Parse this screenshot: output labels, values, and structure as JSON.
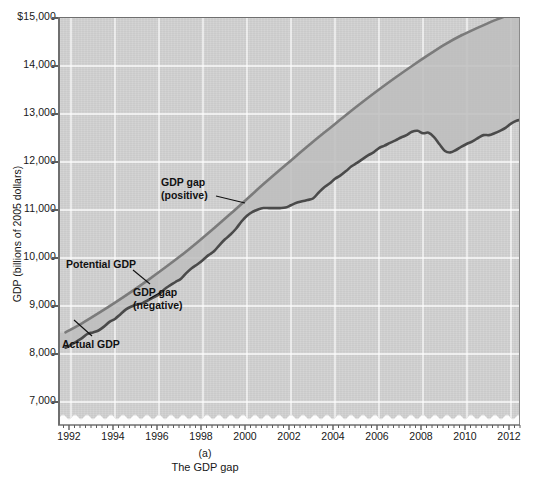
{
  "figure": {
    "panel_label": "(a)",
    "caption": "The GDP gap",
    "y_axis_title": "GDP (billions of 2005 dollars)",
    "background_color": "#d2d2d2",
    "gridline_color": "#ffffff",
    "axis_color": "#6f6f6f"
  },
  "annotations": {
    "gap_positive_line1": "GDP gap",
    "gap_positive_line2": "(positive)",
    "potential": "Potential GDP",
    "gap_negative_line1": "GDP gap",
    "gap_negative_line2": "(negative)",
    "actual": "Actual GDP"
  },
  "chart_data": {
    "type": "line",
    "title": "The GDP gap",
    "subtitle": "(a)",
    "xlabel": "",
    "ylabel": "GDP (billions of 2005 dollars)",
    "xlim": [
      1991.5,
      2012.5
    ],
    "ylim": [
      6500,
      15000
    ],
    "y_axis_break": true,
    "grid": true,
    "legend_position": "inline-annotations",
    "x_tick_labels": [
      "1992",
      "1994",
      "1996",
      "1998",
      "2000",
      "2002",
      "2004",
      "2006",
      "2008",
      "2010",
      "2012"
    ],
    "x_tick_values": [
      1992,
      1994,
      1996,
      1998,
      2000,
      2002,
      2004,
      2006,
      2008,
      2010,
      2012
    ],
    "x_minor_tick_interval": 0.25,
    "y_tick_labels": [
      "$15,000",
      "14,000",
      "13,000",
      "12,000",
      "11,000",
      "10,000",
      "9,000",
      "8,000",
      "7,000"
    ],
    "y_tick_values": [
      15000,
      14000,
      13000,
      12000,
      11000,
      10000,
      9000,
      8000,
      7000
    ],
    "series": [
      {
        "name": "Potential GDP",
        "color": "#7b7b7b",
        "line_width": 2.6,
        "x": [
          1991.75,
          1992.5,
          1993.25,
          1994.0,
          1994.75,
          1995.5,
          1996.25,
          1997.0,
          1997.75,
          1998.5,
          1999.25,
          2000.0,
          2000.75,
          2001.5,
          2002.25,
          2003.0,
          2003.75,
          2004.5,
          2005.25,
          2006.0,
          2006.75,
          2007.5,
          2008.25,
          2009.0,
          2009.75,
          2010.5,
          2011.25,
          2012.0,
          2012.5
        ],
        "values": [
          8450,
          8640,
          8850,
          9070,
          9300,
          9540,
          9790,
          10050,
          10330,
          10620,
          10920,
          11230,
          11540,
          11840,
          12130,
          12420,
          12700,
          12980,
          13250,
          13510,
          13760,
          14000,
          14230,
          14450,
          14640,
          14800,
          14950,
          15080,
          15160
        ]
      },
      {
        "name": "Actual GDP",
        "color": "#4a4a4a",
        "line_width": 2.6,
        "x": [
          1991.75,
          1992.0,
          1992.25,
          1992.5,
          1992.75,
          1993.0,
          1993.25,
          1993.5,
          1993.75,
          1994.0,
          1994.25,
          1994.5,
          1994.75,
          1995.0,
          1995.25,
          1995.5,
          1995.75,
          1996.0,
          1996.25,
          1996.5,
          1996.75,
          1997.0,
          1997.25,
          1997.5,
          1997.75,
          1998.0,
          1998.25,
          1998.5,
          1998.75,
          1999.0,
          1999.25,
          1999.5,
          1999.75,
          2000.0,
          2000.25,
          2000.5,
          2000.75,
          2001.0,
          2001.25,
          2001.5,
          2001.75,
          2002.0,
          2002.25,
          2002.5,
          2002.75,
          2003.0,
          2003.25,
          2003.5,
          2003.75,
          2004.0,
          2004.25,
          2004.5,
          2004.75,
          2005.0,
          2005.25,
          2005.5,
          2005.75,
          2006.0,
          2006.25,
          2006.5,
          2006.75,
          2007.0,
          2007.25,
          2007.5,
          2007.75,
          2008.0,
          2008.25,
          2008.5,
          2008.75,
          2009.0,
          2009.25,
          2009.5,
          2009.75,
          2010.0,
          2010.25,
          2010.5,
          2010.75,
          2011.0,
          2011.25,
          2011.5,
          2011.75,
          2012.0,
          2012.25,
          2012.5
        ],
        "values": [
          8130,
          8190,
          8260,
          8330,
          8420,
          8450,
          8490,
          8570,
          8670,
          8730,
          8830,
          8930,
          8990,
          9030,
          9060,
          9120,
          9180,
          9240,
          9350,
          9430,
          9500,
          9570,
          9690,
          9790,
          9870,
          9960,
          10060,
          10140,
          10270,
          10390,
          10490,
          10610,
          10760,
          10880,
          10960,
          11010,
          11040,
          11040,
          11040,
          11040,
          11050,
          11100,
          11150,
          11180,
          11210,
          11240,
          11360,
          11470,
          11550,
          11650,
          11720,
          11810,
          11910,
          11980,
          12060,
          12140,
          12200,
          12290,
          12340,
          12400,
          12450,
          12510,
          12560,
          12630,
          12650,
          12600,
          12610,
          12520,
          12370,
          12230,
          12200,
          12250,
          12320,
          12380,
          12430,
          12500,
          12560,
          12560,
          12600,
          12650,
          12710,
          12800,
          12860,
          12880
        ]
      }
    ],
    "gap_regions": [
      {
        "label": "GDP gap (positive)",
        "start": 1998.6,
        "end": 2001.2,
        "sign": "positive"
      },
      {
        "label": "GDP gap (negative)",
        "start": 1991.75,
        "end": 1998.6,
        "sign": "negative"
      }
    ]
  }
}
